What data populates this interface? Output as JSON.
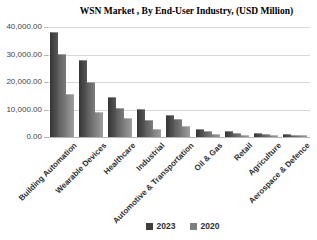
{
  "title": "WSN Market , By End-User Industry, (USD Million)",
  "y_axis": {
    "tick_labels": [
      "40,000.00",
      "30,000.00",
      "20,000.00",
      "10,000.00",
      "0.00"
    ],
    "min": 0,
    "max": 40000,
    "step": 10000
  },
  "legend": {
    "items": [
      {
        "label": "2023",
        "color": "#3f3f3f"
      },
      {
        "label": "2020",
        "color": "#7f7f7f"
      }
    ]
  },
  "colors": {
    "bar_dark_2023": "#474747",
    "bar_medium_2020": "#6e6e6e",
    "bar_light_unlabeled": "#8f8f8f",
    "gridline": "#d8d8d8",
    "axis_line": "#b5b5b5",
    "axis_text": "#3f3f3f",
    "background": "#ffffff"
  },
  "chart_data": {
    "type": "bar",
    "title": "WSN Market , By End-User Industry, (USD Million)",
    "unit": "USD Million",
    "categories": [
      "Building Automation",
      "Wearable Devices",
      "Healthcare",
      "Industrial",
      "Automotive & Transportation",
      "Oil & Gas",
      "Retail",
      "Agriculture",
      "Aerospace & Defence"
    ],
    "series": [
      {
        "name": "2023",
        "values": [
          38000,
          28000,
          14500,
          10000,
          8000,
          3000,
          2000,
          1500,
          1000
        ]
      },
      {
        "name": "2020",
        "values": [
          30000,
          20000,
          10500,
          6000,
          6500,
          2000,
          1500,
          1000,
          700
        ]
      },
      {
        "name": "unlabeled-third-column",
        "values": [
          15500,
          9000,
          7000,
          3000,
          4000,
          1000,
          700,
          500,
          300
        ]
      }
    ],
    "ylim": [
      0,
      40000
    ],
    "grid": true,
    "legend_position": "bottom",
    "legend_entries": [
      "2023",
      "2020"
    ]
  }
}
